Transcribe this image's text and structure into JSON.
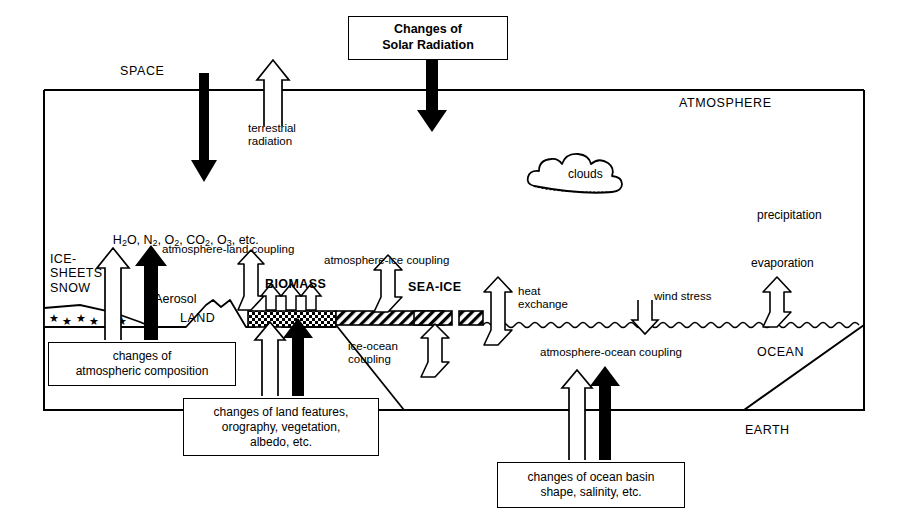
{
  "diagram": {
    "regions": {
      "space": "SPACE",
      "atmosphere": "ATMOSPHERE",
      "ocean": "OCEAN",
      "earth": "EARTH",
      "land": "LAND",
      "ice_sheets": "ICE-\nSHEETS\nSNOW",
      "biomass": "BIOMASS",
      "sea_ice": "SEA-ICE",
      "clouds": "clouds"
    },
    "atmosphere_composition": {
      "line1_parts": [
        "H",
        "2",
        "O, N",
        "2",
        ", O",
        "2",
        ", CO",
        "2",
        ", O",
        "3",
        ", etc."
      ],
      "line1_plain": "H2O, N2, O2, CO2, O3, etc.",
      "line2": "Aerosol"
    },
    "flux_labels": {
      "terrestrial_radiation": "terrestrial\nradiation",
      "precipitation": "precipitation",
      "evaporation": "evaporation",
      "heat_exchange": "heat\nexchange",
      "wind_stress": "wind stress",
      "atmosphere_land_coupling": "atmosphere-land coupling",
      "atmosphere_ice_coupling": "atmosphere-ice coupling",
      "atmosphere_ocean_coupling": "atmosphere-ocean coupling",
      "ice_ocean_coupling": "ice-ocean\ncoupling"
    },
    "forcing_boxes": [
      {
        "id": "solar",
        "text": "Changes of\nSolar Radiation"
      },
      {
        "id": "atmospheric-composition",
        "text": "changes of\natmospheric composition"
      },
      {
        "id": "land-features",
        "text": "changes of land features,\norography, vegetation,\nalbedo, etc."
      },
      {
        "id": "ocean-basin",
        "text": "changes of ocean basin\nshape, salinity, etc."
      }
    ],
    "colors": {
      "ink": "#000000",
      "paper": "#ffffff"
    }
  }
}
